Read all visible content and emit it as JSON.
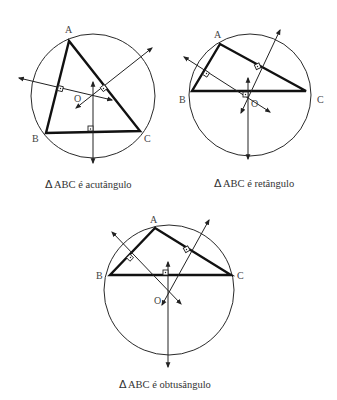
{
  "figures": [
    {
      "id": "acute",
      "caption": {
        "delta": "Δ",
        "text": "ABC é acutângulo"
      },
      "labels": {
        "A": "A",
        "B": "B",
        "C": "C",
        "O": "O"
      },
      "circle": {
        "cx": 93,
        "cy": 96,
        "r": 62
      },
      "points": {
        "A": [
          69,
          41
        ],
        "B": [
          46,
          133
        ],
        "C": [
          140,
          131
        ],
        "O": [
          92,
          96
        ]
      }
    },
    {
      "id": "right",
      "caption": {
        "delta": "Δ",
        "text": "ABC é retângulo"
      },
      "labels": {
        "A": "A",
        "B": "B",
        "C": "C",
        "O": "O"
      },
      "circle": {
        "cx": 250,
        "cy": 95,
        "r": 61
      },
      "points": {
        "A": [
          220,
          44
        ],
        "B": [
          192,
          91
        ],
        "C": [
          306,
          91
        ],
        "O": [
          248,
          91
        ]
      }
    },
    {
      "id": "obtuse",
      "caption": {
        "delta": "Δ",
        "text": "ABC é obtusângulo"
      },
      "labels": {
        "A": "A",
        "B": "B",
        "C": "C",
        "O": "O"
      },
      "circle": {
        "cx": 169,
        "cy": 290,
        "r": 65
      },
      "points": {
        "A": [
          155,
          228
        ],
        "B": [
          110,
          275
        ],
        "C": [
          231,
          275
        ],
        "O": [
          168,
          291
        ]
      }
    }
  ],
  "colors": {
    "line": "#111111",
    "text": "#333333",
    "background": "#ffffff"
  }
}
